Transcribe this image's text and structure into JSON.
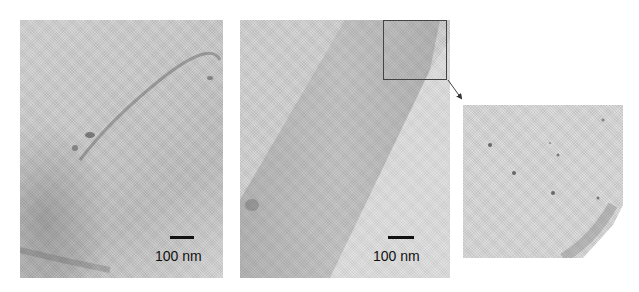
{
  "figure": {
    "panels": [
      {
        "id": "left",
        "scale_bar_label": "100 nm"
      },
      {
        "id": "middle",
        "scale_bar_label": "100 nm"
      },
      {
        "id": "inset-zoom"
      }
    ],
    "colors": {
      "background": "#ffffff",
      "film_gray": "#c8c8c8",
      "dark_band": "#a8a8a8",
      "scale_bar": "#111111"
    }
  }
}
